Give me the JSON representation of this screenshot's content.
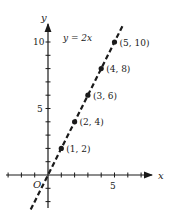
{
  "chart_data": {
    "type": "line",
    "title": "",
    "equation_label": "y = 2x",
    "xlabel": "x",
    "ylabel": "y",
    "origin_label": "O",
    "x_tick_labels": [
      "5"
    ],
    "y_tick_labels": [
      "5",
      "10"
    ],
    "xlim": [
      -3,
      8
    ],
    "ylim": [
      -3,
      12
    ],
    "line_style": "dashed",
    "series": [
      {
        "name": "y = 2x",
        "x": [
          1,
          2,
          3,
          4,
          5
        ],
        "y": [
          2,
          4,
          6,
          8,
          10
        ]
      }
    ],
    "point_labels": [
      "(1, 2)",
      "(2, 4)",
      "(3, 6)",
      "(4, 8)",
      "(5, 10)"
    ],
    "grid": false,
    "legend": "none"
  }
}
